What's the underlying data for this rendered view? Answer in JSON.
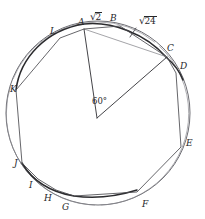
{
  "labels": {
    "vertices": [
      {
        "id": "A",
        "text": "A",
        "x": 78,
        "y": 18
      },
      {
        "id": "B",
        "text": "B",
        "x": 110,
        "y": 14
      },
      {
        "id": "C",
        "text": "C",
        "x": 167,
        "y": 44
      },
      {
        "id": "D",
        "text": "D",
        "x": 180,
        "y": 62
      },
      {
        "id": "E",
        "text": "E",
        "x": 186,
        "y": 139
      },
      {
        "id": "F",
        "text": "F",
        "x": 142,
        "y": 200
      },
      {
        "id": "G",
        "text": "G",
        "x": 62,
        "y": 203
      },
      {
        "id": "H",
        "text": "H",
        "x": 44,
        "y": 194
      },
      {
        "id": "I",
        "text": "I",
        "x": 29,
        "y": 181
      },
      {
        "id": "J",
        "text": "J",
        "x": 14,
        "y": 159
      },
      {
        "id": "K",
        "text": "K",
        "x": 10,
        "y": 85
      },
      {
        "id": "L",
        "text": "L",
        "x": 50,
        "y": 27
      }
    ],
    "measures": [
      {
        "id": "chord-ab",
        "sign": "√",
        "body": "2",
        "x": 90,
        "y": 12
      },
      {
        "id": "chord-bc",
        "sign": "√",
        "body": "24",
        "x": 139,
        "y": 16
      }
    ],
    "angle": {
      "id": "central-angle",
      "text": "60°",
      "x": 92,
      "y": 97
    }
  },
  "geometry": {
    "circle": {
      "cx": 98,
      "cy": 113,
      "r": 92
    },
    "center": {
      "cx": 97,
      "cy": 118
    },
    "points": {
      "A": {
        "x": 84,
        "y": 29
      },
      "B": {
        "x": 120,
        "y": 26
      },
      "C": {
        "x": 167,
        "y": 57
      },
      "D": {
        "x": 176,
        "y": 73
      },
      "E": {
        "x": 181,
        "y": 147
      },
      "F": {
        "x": 137,
        "y": 192
      },
      "G": {
        "x": 74,
        "y": 196
      },
      "H": {
        "x": 56,
        "y": 190
      },
      "I": {
        "x": 38,
        "y": 179
      },
      "J": {
        "x": 22,
        "y": 163
      },
      "K": {
        "x": 16,
        "y": 90
      },
      "L": {
        "x": 60,
        "y": 38
      }
    },
    "polygon_order": [
      "A",
      "B",
      "C",
      "D",
      "E",
      "F",
      "G",
      "H",
      "I",
      "J",
      "K",
      "L"
    ],
    "radii": [
      "A",
      "C"
    ]
  },
  "colors": {
    "ink": "#3a3a3e",
    "ink_light": "#7a7a80",
    "arc_heavy": "#2b2b2e",
    "background": "#ffffff"
  }
}
